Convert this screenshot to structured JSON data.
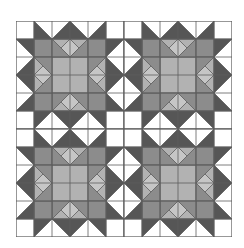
{
  "quilt": {
    "title": "Star quilt pattern",
    "blocks_across": 2,
    "blocks_down": 2,
    "cells_per_block": 6,
    "cell_size_px": 18,
    "colors": {
      "white": "#ffffff",
      "dark": "#565656",
      "medium": "#8c8c8c",
      "light": "#b2b2b2",
      "diamond": "#c6c6c6",
      "line": "#5e5e5e"
    }
  }
}
